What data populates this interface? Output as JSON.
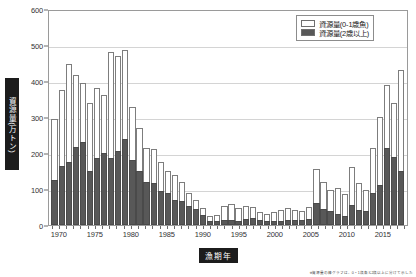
{
  "chart_data": {
    "type": "bar",
    "stacked": true,
    "title": "",
    "xlabel": "漁期年",
    "ylabel": "資源量(万トン)",
    "ylim": [
      0,
      600
    ],
    "ytick_values": [
      0,
      100,
      200,
      300,
      400,
      500,
      600
    ],
    "ytick_labels": [
      "0",
      "100",
      "200",
      "300",
      "400",
      "500",
      "600"
    ],
    "grid": true,
    "grid_axis": "y",
    "xlim": [
      1968.5,
      2018.5
    ],
    "xtick_labels": [
      "1970",
      "1975",
      "1980",
      "1985",
      "1990",
      "1995",
      "2000",
      "2005",
      "2010",
      "2015"
    ],
    "xtick_values": [
      1970,
      1975,
      1980,
      1985,
      1990,
      1995,
      2000,
      2005,
      2010,
      2015
    ],
    "legend_position": "top-right",
    "categories": [
      1969,
      1970,
      1971,
      1972,
      1973,
      1974,
      1975,
      1976,
      1977,
      1978,
      1979,
      1980,
      1981,
      1982,
      1983,
      1984,
      1985,
      1986,
      1987,
      1988,
      1989,
      1990,
      1991,
      1992,
      1993,
      1994,
      1995,
      1996,
      1997,
      1998,
      1999,
      2000,
      2001,
      2002,
      2003,
      2004,
      2005,
      2006,
      2007,
      2008,
      2009,
      2010,
      2011,
      2012,
      2013,
      2014,
      2015,
      2016,
      2017,
      2018
    ],
    "series": [
      {
        "name": "資源量(2歳以上)",
        "color": "#585858",
        "values": [
          125,
          163,
          175,
          216,
          230,
          150,
          185,
          200,
          185,
          205,
          238,
          180,
          150,
          120,
          118,
          95,
          88,
          70,
          68,
          52,
          45,
          28,
          12,
          10,
          14,
          13,
          12,
          18,
          20,
          14,
          12,
          10,
          11,
          13,
          14,
          15,
          18,
          60,
          45,
          38,
          30,
          26,
          55,
          42,
          38,
          90,
          110,
          215,
          190,
          150
        ]
      },
      {
        "name": "資源量(0-1歳魚)",
        "color": "#ffffff",
        "values": [
          170,
          212,
          273,
          202,
          165,
          190,
          195,
          160,
          295,
          265,
          247,
          148,
          120,
          95,
          92,
          80,
          62,
          68,
          52,
          38,
          25,
          18,
          13,
          18,
          40,
          45,
          35,
          35,
          30,
          22,
          20,
          25,
          30,
          35,
          28,
          25,
          32,
          95,
          75,
          60,
          72,
          60,
          105,
          75,
          60,
          125,
          190,
          175,
          150,
          280
        ]
      }
    ],
    "totals": [
      295,
      375,
      448,
      418,
      395,
      340,
      380,
      360,
      480,
      470,
      485,
      328,
      270,
      215,
      210,
      175,
      150,
      138,
      120,
      90,
      70,
      46,
      25,
      28,
      54,
      58,
      47,
      53,
      50,
      36,
      32,
      35,
      41,
      48,
      42,
      40,
      50,
      155,
      120,
      98,
      102,
      86,
      160,
      117,
      98,
      215,
      300,
      390,
      340,
      430
    ]
  },
  "legend": {
    "items": [
      {
        "label": "資源量(0-1歳魚)",
        "swatch": "white"
      },
      {
        "label": "資源量(2歳以上)",
        "swatch": "dark"
      }
    ]
  },
  "axes": {
    "y_title": "資源量(万トン)",
    "x_title": "漁期年"
  },
  "caption": "※資源量の棒グラフは、0・1歳魚と2歳以上に分けて示した"
}
